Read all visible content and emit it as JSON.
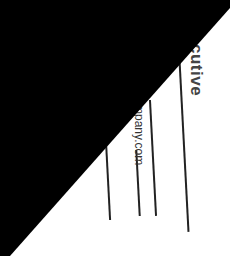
{
  "photo": {
    "description": "Photograph of a rotated white business card, partially covered by a black triangular region",
    "card": {
      "title_fragment": "cutive",
      "email_fragment": "mpany.com"
    },
    "colors": {
      "card": "#ffffff",
      "occluder": "#000000",
      "shadow": "#8f8f8f",
      "text": "#444444"
    }
  }
}
